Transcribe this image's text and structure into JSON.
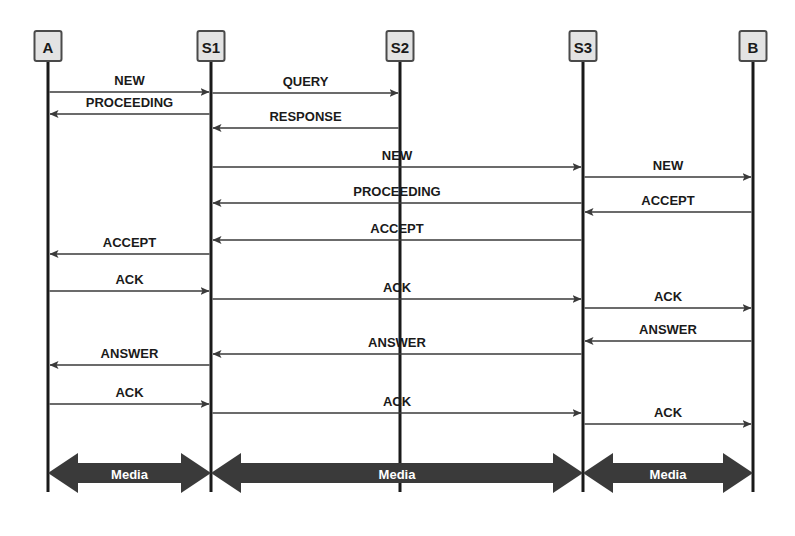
{
  "diagram": {
    "type": "sequence-diagram",
    "colors": {
      "actor_fill": "#e3e3e3",
      "actor_border": "#4a4a4a",
      "lifeline": "#1a1a1a",
      "message_line": "#3a3a3a",
      "media_arrow": "#3a3a3a",
      "media_text": "#ffffff",
      "background": "#ffffff"
    },
    "actors": [
      {
        "id": "A",
        "label": "A",
        "x": 48
      },
      {
        "id": "S1",
        "label": "S1",
        "x": 211
      },
      {
        "id": "S2",
        "label": "S2",
        "x": 400
      },
      {
        "id": "S3",
        "label": "S3",
        "x": 583
      },
      {
        "id": "B",
        "label": "B",
        "x": 753
      }
    ],
    "messages": [
      {
        "label": "NEW",
        "from": "A",
        "to": "S1",
        "y": 92,
        "dir": "right"
      },
      {
        "label": "QUERY",
        "from": "S1",
        "to": "S2",
        "y": 93,
        "dir": "right"
      },
      {
        "label": "PROCEEDING",
        "from": "S1",
        "to": "A",
        "y": 114,
        "dir": "left"
      },
      {
        "label": "RESPONSE",
        "from": "S2",
        "to": "S1",
        "y": 128,
        "dir": "left"
      },
      {
        "label": "NEW",
        "from": "S1",
        "to": "S3",
        "y": 167,
        "dir": "right"
      },
      {
        "label": "NEW",
        "from": "S3",
        "to": "B",
        "y": 177,
        "dir": "right"
      },
      {
        "label": "PROCEEDING",
        "from": "S3",
        "to": "S1",
        "y": 203,
        "dir": "left"
      },
      {
        "label": "ACCEPT",
        "from": "B",
        "to": "S3",
        "y": 212,
        "dir": "left"
      },
      {
        "label": "ACCEPT",
        "from": "S3",
        "to": "S1",
        "y": 240,
        "dir": "left"
      },
      {
        "label": "ACCEPT",
        "from": "S1",
        "to": "A",
        "y": 254,
        "dir": "left"
      },
      {
        "label": "ACK",
        "from": "A",
        "to": "S1",
        "y": 291,
        "dir": "right"
      },
      {
        "label": "ACK",
        "from": "S1",
        "to": "S3",
        "y": 299,
        "dir": "right"
      },
      {
        "label": "ACK",
        "from": "S3",
        "to": "B",
        "y": 308,
        "dir": "right"
      },
      {
        "label": "ANSWER",
        "from": "B",
        "to": "S3",
        "y": 341,
        "dir": "left"
      },
      {
        "label": "ANSWER",
        "from": "S3",
        "to": "S1",
        "y": 354,
        "dir": "left"
      },
      {
        "label": "ANSWER",
        "from": "S1",
        "to": "A",
        "y": 365,
        "dir": "left"
      },
      {
        "label": "ACK",
        "from": "A",
        "to": "S1",
        "y": 404,
        "dir": "right"
      },
      {
        "label": "ACK",
        "from": "S1",
        "to": "S3",
        "y": 413,
        "dir": "right"
      },
      {
        "label": "ACK",
        "from": "S3",
        "to": "B",
        "y": 424,
        "dir": "right"
      }
    ],
    "media_flows": [
      {
        "label": "Media",
        "from": "A",
        "to": "S1",
        "y": 473
      },
      {
        "label": "Media",
        "from": "S1",
        "to": "S3",
        "y": 473
      },
      {
        "label": "Media",
        "from": "S3",
        "to": "B",
        "y": 473
      }
    ]
  }
}
